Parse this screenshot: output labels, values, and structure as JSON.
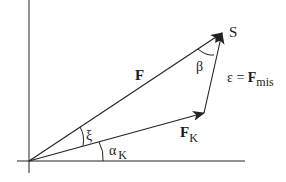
{
  "diagram": {
    "points": {
      "origin_label": "",
      "tip_label": "S"
    },
    "vectors": {
      "F": {
        "label": "F"
      },
      "F_K": {
        "label": "F",
        "subscript": "K"
      },
      "eps": {
        "label_prefix": "ε = ",
        "label": "F",
        "subscript": "mis"
      }
    },
    "angles": {
      "beta": "β",
      "xi": "ξ",
      "alpha_K": {
        "label": "α",
        "subscript": "K"
      }
    },
    "colors": {
      "stroke": "#222222",
      "background": "#ffffff"
    }
  }
}
